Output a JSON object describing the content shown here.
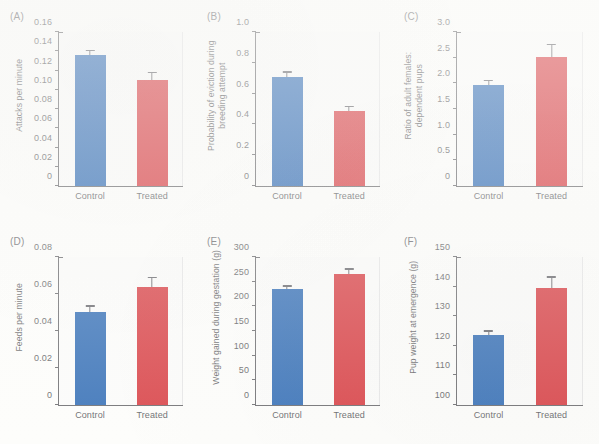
{
  "figure": {
    "categories": [
      "Control",
      "Treated"
    ],
    "colors": {
      "control": "#1a5cad",
      "treated": "#d4262c",
      "axis": "#58585c",
      "text": "#4d4d51"
    }
  },
  "chart_data": [
    {
      "type": "bar",
      "panel": "(A)",
      "title": "",
      "ylabel": "Attacks per minute",
      "xlabel": "",
      "categories": [
        "Control",
        "Treated"
      ],
      "values": [
        0.136,
        0.11
      ],
      "errors": [
        0.0065,
        0.0125
      ],
      "ylim": [
        0,
        0.16
      ],
      "yticks": [
        0,
        0.02,
        0.04,
        0.06,
        0.08,
        0.1,
        0.12,
        0.14,
        0.16
      ],
      "ytick_labels": [
        "0",
        "0.02",
        "0.04",
        "0.06",
        "0.08",
        "0.10",
        "0.12",
        "0.14",
        "0.16"
      ],
      "grid": false,
      "legend": "none"
    },
    {
      "type": "bar",
      "panel": "(B)",
      "title": "",
      "ylabel": "Probability of eviction during\nbreeding attempt",
      "xlabel": "",
      "categories": [
        "Control",
        "Treated"
      ],
      "values": [
        0.71,
        0.49
      ],
      "errors": [
        0.05,
        0.065
      ],
      "ylim": [
        0,
        1.0
      ],
      "yticks": [
        0,
        0.2,
        0.4,
        0.6,
        0.8,
        1.0
      ],
      "ytick_labels": [
        "0",
        "0.2",
        "0.4",
        "0.6",
        "0.8",
        "1.0"
      ],
      "grid": false,
      "legend": "none"
    },
    {
      "type": "bar",
      "panel": "(C)",
      "title": "",
      "ylabel": "Ratio of adult females:\ndependent pups",
      "xlabel": "",
      "categories": [
        "Control",
        "Treated"
      ],
      "values": [
        1.96,
        2.51
      ],
      "errors": [
        0.16,
        0.31
      ],
      "ylim": [
        0,
        3.0
      ],
      "yticks": [
        0,
        0.5,
        1.0,
        1.5,
        2.0,
        2.5,
        3.0
      ],
      "ytick_labels": [
        "0",
        "0.5",
        "1.0",
        "1.5",
        "2.0",
        "2.5",
        "3.0"
      ],
      "grid": false,
      "legend": "none"
    },
    {
      "type": "bar",
      "panel": "(D)",
      "title": "",
      "ylabel": "Feeds per minute",
      "xlabel": "",
      "categories": [
        "Control",
        "Treated"
      ],
      "values": [
        0.0505,
        0.064
      ],
      "errors": [
        0.0055,
        0.0065
      ],
      "ylim": [
        0,
        0.08
      ],
      "yticks": [
        0,
        0.02,
        0.04,
        0.06,
        0.08
      ],
      "ytick_labels": [
        "0",
        "0.02",
        "0.04",
        "0.06",
        "0.08"
      ],
      "grid": false,
      "legend": "none"
    },
    {
      "type": "bar",
      "panel": "(E)",
      "title": "",
      "ylabel": "Weight gained during gestation (g)",
      "xlabel": "",
      "categories": [
        "Control",
        "Treated"
      ],
      "values": [
        235,
        266
      ],
      "errors": [
        10,
        13
      ],
      "ylim": [
        0,
        300
      ],
      "yticks": [
        0,
        50,
        100,
        150,
        200,
        250,
        300
      ],
      "ytick_labels": [
        "0",
        "50",
        "100",
        "150",
        "200",
        "250",
        "300"
      ],
      "grid": false,
      "legend": "none"
    },
    {
      "type": "bar",
      "panel": "(F)",
      "title": "",
      "ylabel": "Pup weight at emergence (g)",
      "xlabel": "",
      "categories": [
        "Control",
        "Treated"
      ],
      "values": [
        123.5,
        139.5
      ],
      "errors": [
        3.7,
        5.0
      ],
      "ylim": [
        100,
        150
      ],
      "yticks": [
        100,
        110,
        120,
        130,
        140,
        150
      ],
      "ytick_labels": [
        "100",
        "110",
        "120",
        "130",
        "140",
        "150"
      ],
      "grid": false,
      "legend": "none"
    }
  ]
}
